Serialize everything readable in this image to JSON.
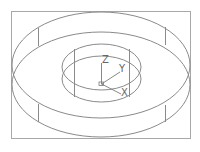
{
  "drawing": {
    "type": "wireframe-ring",
    "line_color": "#8a8a8a",
    "frame_color": "#a8a8a8",
    "background": "#ffffff"
  },
  "axes": {
    "x_label": "X",
    "y_label": "Y",
    "z_label": "Z"
  }
}
